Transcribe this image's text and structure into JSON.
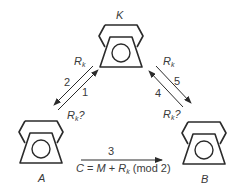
{
  "nodes": {
    "key_server": {
      "label": "K"
    },
    "alice": {
      "label": "A"
    },
    "bob": {
      "label": "B"
    }
  },
  "edges": [
    {
      "step": "1",
      "from": "A",
      "to": "K",
      "label": "Rk?"
    },
    {
      "step": "2",
      "from": "K",
      "to": "A",
      "label": "Rk"
    },
    {
      "step": "3",
      "from": "A",
      "to": "B",
      "label": "C = M + Rk (mod 2)"
    },
    {
      "step": "4",
      "from": "B",
      "to": "K",
      "label": "Rk?"
    },
    {
      "step": "5",
      "from": "K",
      "to": "B",
      "label": "Rk"
    }
  ],
  "labels": {
    "step1": "1",
    "step2": "2",
    "step3": "3",
    "step4": "4",
    "step5": "5",
    "R": "R",
    "k": "k",
    "q": "?",
    "formula_C": "C",
    "formula_eq": " = ",
    "formula_M": "M",
    "formula_plus": " + ",
    "formula_mod": " (mod 2)"
  },
  "colors": {
    "stroke": "#2b2b2b",
    "text": "#3a3a3a"
  }
}
